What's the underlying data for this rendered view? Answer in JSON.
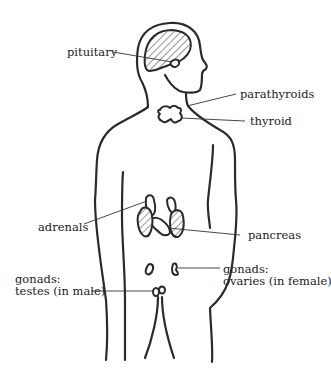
{
  "diagram": {
    "labels": {
      "pituitary": "pituitary",
      "parathyroids": "parathyroids",
      "thyroid": "thyroid",
      "adrenals": "adrenals",
      "pancreas": "pancreas",
      "gonads_female_line1": "gonads:",
      "gonads_female_line2": "ovaries (in female)",
      "gonads_male_line1": "gonads:",
      "gonads_male_line2": "testes (in male)"
    },
    "colors": {
      "stroke": "#2a2a2a",
      "background": "#ffffff"
    }
  }
}
